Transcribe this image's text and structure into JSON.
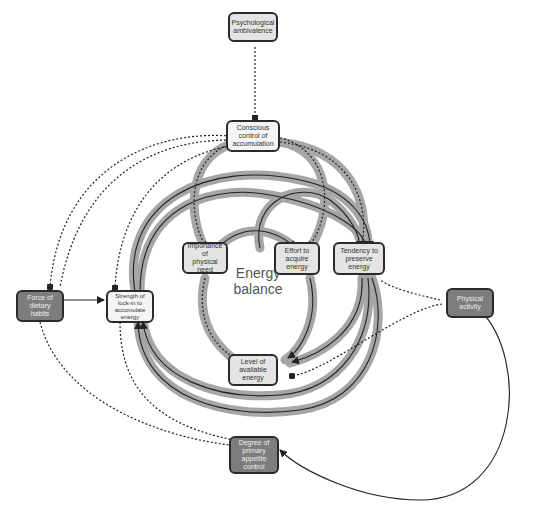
{
  "diagram": {
    "center_label": "Energy balance",
    "center_label_lines": [
      "Energy",
      "balance"
    ],
    "colors": {
      "loop_band": "#a6a6a6",
      "line": "#222222",
      "dark_node": "#7d7d7d",
      "light_node": "#e4e4e4",
      "border": "#2a2a2a"
    },
    "nodes": [
      {
        "id": "psychological-ambivalence",
        "label": "Psychological ambivalence",
        "lines": [
          "Psychological",
          "ambivalence"
        ],
        "style": "light"
      },
      {
        "id": "conscious-control",
        "label": "Conscious control of accumulation",
        "lines": [
          "Conscious",
          "control of",
          "accumulation"
        ],
        "style": "lighter"
      },
      {
        "id": "importance-physical-need",
        "label": "Importance of physical need",
        "lines": [
          "Importance of",
          "physical need"
        ],
        "style": "light"
      },
      {
        "id": "effort-acquire-energy",
        "label": "Effort to acquire energy",
        "lines": [
          "Effort to",
          "acquire",
          "energy"
        ],
        "style": "light"
      },
      {
        "id": "tendency-preserve-energy",
        "label": "Tendency to preserve energy",
        "lines": [
          "Tendency to",
          "preserve",
          "energy"
        ],
        "style": "light"
      },
      {
        "id": "force-dietary-habits",
        "label": "Force of dietary habits",
        "lines": [
          "Force of",
          "dietary",
          "habits"
        ],
        "style": "dark"
      },
      {
        "id": "strength-lock-in",
        "label": "Strength of lock-in to accumulate energy",
        "lines": [
          "Strength of",
          "lock-in to",
          "accumulate",
          "energy"
        ],
        "style": "lighter"
      },
      {
        "id": "physical-activity",
        "label": "Physical activity",
        "lines": [
          "Physical",
          "activity"
        ],
        "style": "dark"
      },
      {
        "id": "level-available-energy",
        "label": "Level of available energy",
        "lines": [
          "Level of",
          "available",
          "energy"
        ],
        "style": "light"
      },
      {
        "id": "degree-appetite-control",
        "label": "Degree of primary appetite control",
        "lines": [
          "Degree of",
          "primary",
          "appetite",
          "control"
        ],
        "style": "dark"
      }
    ]
  }
}
